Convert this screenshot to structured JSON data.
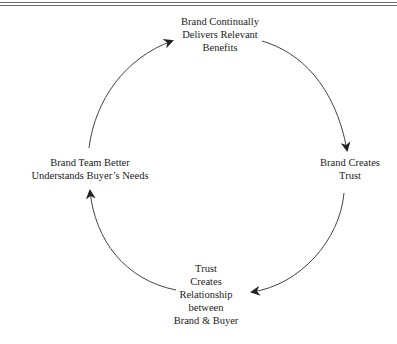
{
  "diagram": {
    "type": "cycle",
    "title": "",
    "colors": {
      "stroke": "#444444",
      "text": "#222222",
      "rule": "#6a6a6a"
    },
    "nodes": [
      {
        "id": "top",
        "lines": [
          "Brand Continually",
          "Delivers Relevant",
          "Benefits"
        ]
      },
      {
        "id": "right",
        "lines": [
          "Brand Creates",
          "Trust"
        ]
      },
      {
        "id": "bottom",
        "lines": [
          "Trust",
          "Creates",
          "Relationship",
          "between",
          "Brand & Buyer"
        ]
      },
      {
        "id": "left",
        "lines": [
          "Brand Team Better",
          "Understands Buyer’s Needs"
        ]
      }
    ],
    "edges": [
      {
        "from": "top",
        "to": "right"
      },
      {
        "from": "right",
        "to": "bottom"
      },
      {
        "from": "bottom",
        "to": "left"
      },
      {
        "from": "left",
        "to": "top"
      }
    ]
  }
}
